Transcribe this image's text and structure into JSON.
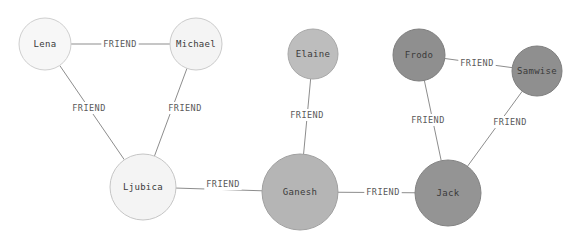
{
  "graph": {
    "canvas": {
      "width": 579,
      "height": 244,
      "background": "#ffffff"
    },
    "style": {
      "edge_color": "#8d8d8d",
      "node_label_color": "#3a3a3a",
      "edge_label_color": "#5a5a5a"
    },
    "nodes": [
      {
        "id": "lena",
        "label": "Lena",
        "cx": 45,
        "cy": 44,
        "r": 26,
        "fill": "#f7f7f7",
        "stroke": "#cfcfcf"
      },
      {
        "id": "michael",
        "label": "Michael",
        "cx": 196,
        "cy": 44,
        "r": 26,
        "fill": "#f4f4f4",
        "stroke": "#cbcbcb"
      },
      {
        "id": "ljubica",
        "label": "Ljubica",
        "cx": 143,
        "cy": 187,
        "r": 33,
        "fill": "#f4f4f4",
        "stroke": "#c6c6c6"
      },
      {
        "id": "elaine",
        "label": "Elaine",
        "cx": 313,
        "cy": 54,
        "r": 25,
        "fill": "#bdbdbd",
        "stroke": "#a8a8a8"
      },
      {
        "id": "ganesh",
        "label": "Ganesh",
        "cx": 300,
        "cy": 192,
        "r": 38,
        "fill": "#b5b5b5",
        "stroke": "#a0a0a0"
      },
      {
        "id": "frodo",
        "label": "Frodo",
        "cx": 419,
        "cy": 55,
        "r": 26,
        "fill": "#8f8f8f",
        "stroke": "#7e7e7e"
      },
      {
        "id": "samwise",
        "label": "Samwise",
        "cx": 537,
        "cy": 71,
        "r": 25,
        "fill": "#8f8f8f",
        "stroke": "#7e7e7e"
      },
      {
        "id": "jack",
        "label": "Jack",
        "cx": 448,
        "cy": 193,
        "r": 33,
        "fill": "#949494",
        "stroke": "#838383"
      }
    ],
    "edges": [
      {
        "id": "lena-michael",
        "source": "lena",
        "target": "michael",
        "label": "FRIEND",
        "label_x": 120,
        "label_y": 44
      },
      {
        "id": "lena-ljubica",
        "source": "lena",
        "target": "ljubica",
        "label": "FRIEND",
        "label_x": 89,
        "label_y": 108
      },
      {
        "id": "michael-ljubica",
        "source": "michael",
        "target": "ljubica",
        "label": "FRIEND",
        "label_x": 185,
        "label_y": 108
      },
      {
        "id": "ljubica-ganesh",
        "source": "ljubica",
        "target": "ganesh",
        "label": "FRIEND",
        "label_x": 223,
        "label_y": 184
      },
      {
        "id": "elaine-ganesh",
        "source": "elaine",
        "target": "ganesh",
        "label": "FRIEND",
        "label_x": 307,
        "label_y": 115
      },
      {
        "id": "ganesh-jack",
        "source": "ganesh",
        "target": "jack",
        "label": "FRIEND",
        "label_x": 383,
        "label_y": 192
      },
      {
        "id": "frodo-samwise",
        "source": "frodo",
        "target": "samwise",
        "label": "FRIEND",
        "label_x": 477,
        "label_y": 63
      },
      {
        "id": "frodo-jack",
        "source": "frodo",
        "target": "jack",
        "label": "FRIEND",
        "label_x": 428,
        "label_y": 120
      },
      {
        "id": "samwise-jack",
        "source": "samwise",
        "target": "jack",
        "label": "FRIEND",
        "label_x": 510,
        "label_y": 122
      }
    ]
  }
}
